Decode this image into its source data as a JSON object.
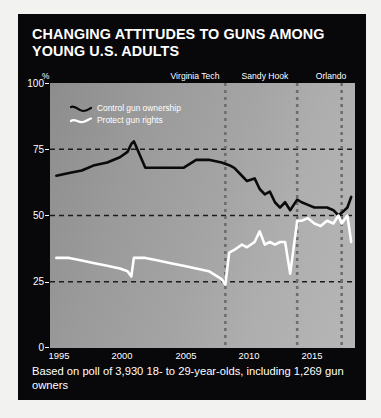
{
  "title": "CHANGING ATTITUDES TO GUNS AMONG YOUNG U.S. ADULTS",
  "caption": "Based on poll of 3,930 18- to 29-year-olds, including 1,269 gun owners",
  "axis": {
    "percent_symbol": "%",
    "y_ticks": [
      "100",
      "75",
      "50",
      "25",
      "0"
    ],
    "x_ticks": [
      "1995",
      "2000",
      "2005",
      "2010",
      "2015"
    ]
  },
  "legend": [
    {
      "label": "Control gun ownership",
      "color": "#0a0a0a",
      "key": "control"
    },
    {
      "label": "Protect gun rights",
      "color": "#ffffff",
      "key": "protect"
    }
  ],
  "events": [
    {
      "name": "Virginia Tech",
      "date": "Apr. 2007",
      "year": 2007.3
    },
    {
      "name": "Sandy Hook",
      "date": "Dec. 2012",
      "year": 2012.95
    },
    {
      "name": "Orlando",
      "date": "June 2016",
      "year": 2016.45
    }
  ],
  "chart_data": {
    "type": "line",
    "title": "CHANGING ATTITUDES TO GUNS AMONG YOUNG U.S. ADULTS",
    "xlabel": "",
    "ylabel": "%",
    "xlim": [
      1993.5,
      2017.5
    ],
    "ylim": [
      0,
      100
    ],
    "yticks": [
      0,
      25,
      50,
      75,
      100
    ],
    "xticks": [
      1995,
      2000,
      2005,
      2010,
      2015
    ],
    "grid": "horizontal-dashed",
    "legend_position": "top-left-inside",
    "series": [
      {
        "name": "Control gun ownership",
        "color": "#0a0a0a",
        "x": [
          1994,
          1995,
          1996,
          1997,
          1998,
          1999,
          1999.6,
          1999.9,
          2000.1,
          2001,
          2002,
          2003,
          2004,
          2005,
          2006,
          2007,
          2007.6,
          2008,
          2008.6,
          2009,
          2009.6,
          2010,
          2010.4,
          2010.8,
          2011.2,
          2011.6,
          2012,
          2012.4,
          2012.95,
          2013.3,
          2013.8,
          2014.3,
          2014.8,
          2015.3,
          2015.8,
          2016.2,
          2016.45,
          2016.9,
          2017.2
        ],
        "y": [
          65,
          66,
          67,
          69,
          70,
          72,
          74,
          77,
          78,
          68,
          68,
          68,
          68,
          71,
          71,
          70,
          69,
          68,
          65,
          63,
          64,
          60,
          58,
          59,
          55,
          53,
          55,
          52,
          56,
          55,
          54,
          53,
          53,
          53,
          52,
          50,
          51,
          53,
          57
        ]
      },
      {
        "name": "Protect gun rights",
        "color": "#ffffff",
        "x": [
          1994,
          1995,
          1996,
          1997,
          1998,
          1999,
          1999.6,
          1999.9,
          2000.1,
          2001,
          2002,
          2003,
          2004,
          2005,
          2006,
          2007,
          2007.3,
          2007.6,
          2008,
          2008.6,
          2009,
          2009.6,
          2010,
          2010.4,
          2010.8,
          2011.2,
          2011.6,
          2012,
          2012.4,
          2012.95,
          2013.3,
          2013.8,
          2014.3,
          2014.8,
          2015.3,
          2015.8,
          2016.2,
          2016.45,
          2016.9,
          2017.2
        ],
        "y": [
          34,
          34,
          33,
          32,
          31,
          30,
          29,
          27,
          34,
          34,
          33,
          32,
          31,
          30,
          29,
          26,
          24,
          36,
          37,
          39,
          38,
          40,
          44,
          39,
          40,
          39,
          40,
          40,
          28,
          48,
          48,
          49,
          47,
          46,
          48,
          47,
          50,
          47,
          50,
          40
        ]
      }
    ],
    "annotations": [
      {
        "label": "Virginia Tech Apr. 2007",
        "x": 2007.3
      },
      {
        "label": "Sandy Hook Dec. 2012",
        "x": 2012.95
      },
      {
        "label": "Orlando June 2016",
        "x": 2016.45
      }
    ]
  }
}
